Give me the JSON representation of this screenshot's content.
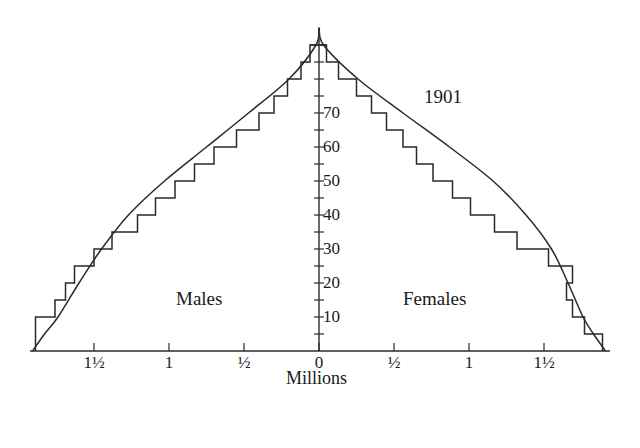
{
  "chart_data": {
    "type": "bar",
    "subtype": "population-pyramid",
    "title": "1901",
    "xlabel": "Millions",
    "ylabel": "Age",
    "side_labels": {
      "left": "Males",
      "right": "Females"
    },
    "y_ticks": [
      10,
      20,
      30,
      40,
      50,
      60,
      70
    ],
    "x_ticks": [
      {
        "value": -1.5,
        "label": "1½"
      },
      {
        "value": -1.0,
        "label": "1"
      },
      {
        "value": -0.5,
        "label": "½"
      },
      {
        "value": 0,
        "label": "0"
      },
      {
        "value": 0.5,
        "label": "½"
      },
      {
        "value": 1.0,
        "label": "1"
      },
      {
        "value": 1.5,
        "label": "1½"
      }
    ],
    "xlim": [
      -1.9,
      1.9
    ],
    "ylim": [
      0,
      95
    ],
    "grid": false,
    "categories": [
      "0-5",
      "5-10",
      "10-15",
      "15-20",
      "20-25",
      "25-30",
      "30-35",
      "35-40",
      "40-45",
      "45-50",
      "50-55",
      "55-60",
      "60-65",
      "65-70",
      "70-75",
      "75-80",
      "80-85",
      "85-90"
    ],
    "series": [
      {
        "name": "Males",
        "values": [
          1.89,
          1.89,
          1.76,
          1.69,
          1.63,
          1.5,
          1.38,
          1.21,
          1.09,
          0.96,
          0.83,
          0.7,
          0.55,
          0.4,
          0.3,
          0.21,
          0.12,
          0.06
        ]
      },
      {
        "name": "Females",
        "values": [
          1.89,
          1.77,
          1.69,
          1.65,
          1.69,
          1.53,
          1.32,
          1.17,
          1.01,
          0.89,
          0.76,
          0.65,
          0.56,
          0.45,
          0.35,
          0.25,
          0.13,
          0.05
        ]
      }
    ],
    "overlay_curve": {
      "description": "Smooth envelope curve (stable population model) drawn over the stepped histogram",
      "points_left": [
        [
          0,
          1.91
        ],
        [
          5,
          1.83
        ],
        [
          10,
          1.74
        ],
        [
          20,
          1.6
        ],
        [
          30,
          1.45
        ],
        [
          40,
          1.27
        ],
        [
          50,
          1.03
        ],
        [
          60,
          0.75
        ],
        [
          70,
          0.47
        ],
        [
          80,
          0.2
        ],
        [
          90,
          0.02
        ],
        [
          95,
          0
        ]
      ],
      "points_right": [
        [
          0,
          1.91
        ],
        [
          5,
          1.83
        ],
        [
          10,
          1.76
        ],
        [
          20,
          1.66
        ],
        [
          30,
          1.55
        ],
        [
          40,
          1.38
        ],
        [
          50,
          1.16
        ],
        [
          60,
          0.87
        ],
        [
          70,
          0.56
        ],
        [
          80,
          0.26
        ],
        [
          90,
          0.03
        ],
        [
          95,
          0
        ]
      ]
    }
  },
  "labels": {
    "title": "1901",
    "males": "Males",
    "females": "Females",
    "xlabel": "Millions"
  },
  "style": {
    "ink": "#2a2a2a",
    "background": "#ffffff"
  }
}
